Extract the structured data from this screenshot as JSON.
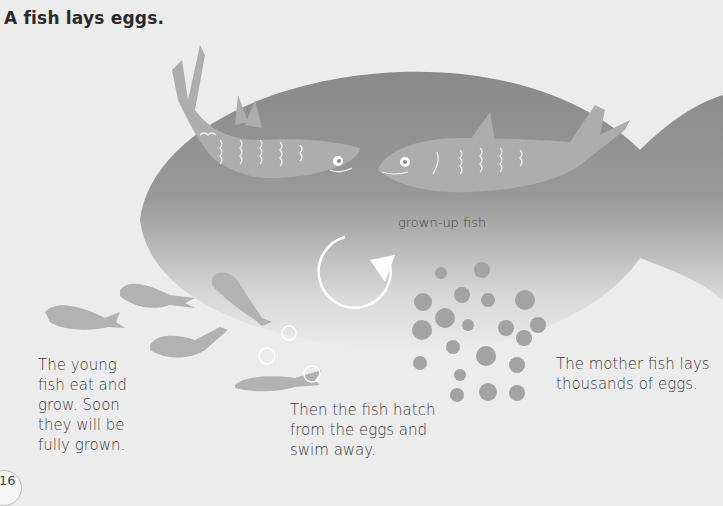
{
  "page": {
    "title": "A fish lays eggs.",
    "page_number": "16"
  },
  "illustration": {
    "elements": [
      "big-fish-silhouette",
      "adult-fish-left",
      "adult-fish-right",
      "cycle-arrow",
      "eggs",
      "young-fish",
      "bubbles"
    ],
    "colors": {
      "background": "#ececec",
      "silhouette_dark": "#8f8f8f",
      "fish": "#a9a9a9",
      "eggs": "#a3a3a3",
      "arrow": "#ffffff"
    }
  },
  "captions": {
    "grown_up": "grown-up fish",
    "young": [
      "The young",
      "fish eat and",
      "grow. Soon",
      "they will be",
      "fully grown."
    ],
    "hatch": [
      "Then the fish hatch",
      "from the eggs and",
      "swim away."
    ],
    "mother": [
      "The mother fish lays",
      "thousands of eggs."
    ]
  }
}
